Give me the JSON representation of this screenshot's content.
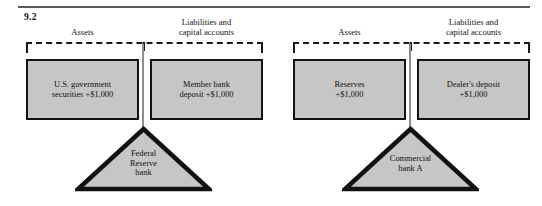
{
  "figure": {
    "number": "9.2",
    "panels": [
      {
        "id": "federal-reserve",
        "assets_label": "Assets",
        "liabilities_label": "Liabilities and\ncapital accounts",
        "asset_box": "U.S. government\nsecurities  +$1,000",
        "liability_box": "Member bank\ndeposit  +$1,000",
        "institution": "Federal\nReserve\nbank"
      },
      {
        "id": "commercial-bank-a",
        "assets_label": "Assets",
        "liabilities_label": "Liabilities and\ncapital accounts",
        "asset_box": "Reserves\n+$1,000",
        "liability_box": "Dealer's deposit\n+$1,000",
        "institution": "Commercial\nbank A"
      }
    ]
  },
  "colors": {
    "box_fill": "#c6c6c6",
    "box_border": "#121212",
    "rule": "#5a5a5a",
    "text": "#14120e",
    "stem": "#8e8e8e"
  }
}
